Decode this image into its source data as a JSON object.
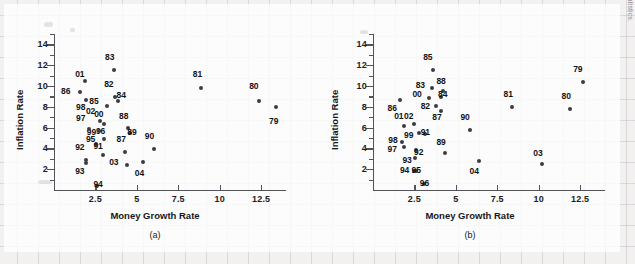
{
  "figure": {
    "source_note": "SOURCE: Federal Reserve System and Bureau of Labor Statistics.",
    "axis_titles": {
      "x": "Money Growth Rate",
      "y": "Inflation Rate"
    },
    "captions": {
      "a": "(a)",
      "b": "(b)"
    }
  },
  "chart_data": [
    {
      "type": "scatter",
      "title": "(a)",
      "xlabel": "Money Growth Rate",
      "ylabel": "Inflation Rate",
      "xlim": [
        0,
        14
      ],
      "ylim": [
        0,
        15
      ],
      "xticks": [
        2.5,
        5,
        7.5,
        10,
        12.5
      ],
      "xtick_labels": [
        "2.5",
        "5",
        "7.5",
        "10",
        "12.5"
      ],
      "yticks": [
        2,
        4,
        6,
        8,
        10,
        12,
        14
      ],
      "ytick_labels": [
        "2",
        "4",
        "6",
        "8",
        "10",
        "12",
        "14"
      ],
      "grid": false,
      "legend": "none",
      "point_label_field": "year",
      "points": [
        {
          "year": "79",
          "x": 13.4,
          "y": 8.0,
          "lx": 13.4,
          "ly": 6.6
        },
        {
          "year": "80",
          "x": 12.4,
          "y": 8.6,
          "lx": 12.2,
          "ly": 10.0
        },
        {
          "year": "81",
          "x": 8.9,
          "y": 9.8,
          "lx": 8.8,
          "ly": 11.2
        },
        {
          "year": "82",
          "x": 3.7,
          "y": 8.9,
          "lx": 3.45,
          "ly": 10.2
        },
        {
          "year": "83",
          "x": 3.65,
          "y": 11.5,
          "lx": 3.5,
          "ly": 12.8
        },
        {
          "year": "84",
          "x": 3.85,
          "y": 8.6,
          "lx": 4.2,
          "ly": 9.1
        },
        {
          "year": "85",
          "x": 3.2,
          "y": 8.1,
          "lx": 2.55,
          "ly": 8.6
        },
        {
          "year": "88",
          "x": 4.45,
          "y": 6.0,
          "lx": 4.35,
          "ly": 7.1
        },
        {
          "year": "89",
          "x": 4.6,
          "y": 5.5,
          "lx": 4.85,
          "ly": 5.6
        },
        {
          "year": "90",
          "x": 6.05,
          "y": 3.9,
          "lx": 5.9,
          "ly": 5.2
        },
        {
          "year": "87",
          "x": 4.3,
          "y": 3.7,
          "lx": 4.2,
          "ly": 4.9
        },
        {
          "year": "03",
          "x": 4.4,
          "y": 2.4,
          "lx": 3.75,
          "ly": 2.7
        },
        {
          "year": "04",
          "x": 5.4,
          "y": 2.7,
          "lx": 5.3,
          "ly": 1.65
        },
        {
          "year": "00",
          "x": 3.0,
          "y": 6.3,
          "lx": 2.85,
          "ly": 7.3
        },
        {
          "year": "02",
          "x": 2.75,
          "y": 6.6,
          "lx": 2.35,
          "ly": 7.6
        },
        {
          "year": "96",
          "x": 3.0,
          "y": 4.9,
          "lx": 2.95,
          "ly": 5.7
        },
        {
          "year": "99",
          "x": 2.7,
          "y": 5.7,
          "lx": 2.4,
          "ly": 5.6
        },
        {
          "year": "95",
          "x": 2.55,
          "y": 4.4,
          "lx": 2.35,
          "ly": 4.9
        },
        {
          "year": "97",
          "x": 2.1,
          "y": 5.9,
          "lx": 1.75,
          "ly": 6.9
        },
        {
          "year": "98",
          "x": 1.95,
          "y": 8.7,
          "lx": 1.75,
          "ly": 8.0
        },
        {
          "year": "91",
          "x": 2.95,
          "y": 3.4,
          "lx": 2.8,
          "ly": 4.2
        },
        {
          "year": "92",
          "x": 1.95,
          "y": 2.9,
          "lx": 1.7,
          "ly": 4.1
        },
        {
          "year": "93",
          "x": 1.95,
          "y": 2.6,
          "lx": 1.7,
          "ly": 1.8
        },
        {
          "year": "94",
          "x": 2.6,
          "y": 0.4,
          "lx": 2.8,
          "ly": 0.6
        },
        {
          "year": "01",
          "x": 1.85,
          "y": 10.5,
          "lx": 1.7,
          "ly": 11.2
        },
        {
          "year": "86",
          "x": 1.55,
          "y": 9.4,
          "lx": 0.85,
          "ly": 9.5
        }
      ]
    },
    {
      "type": "scatter",
      "title": "(b)",
      "xlabel": "Money Growth Rate",
      "ylabel": "Inflation Rate",
      "xlim": [
        0,
        14
      ],
      "ylim": [
        0,
        15
      ],
      "xticks": [
        2.5,
        5,
        7.5,
        10,
        12.5
      ],
      "xtick_labels": [
        "2.5",
        "5",
        "7.5",
        "10",
        "12.5"
      ],
      "yticks": [
        2,
        4,
        6,
        8,
        10,
        12,
        14
      ],
      "ytick_labels": [
        "2",
        "4",
        "6",
        "8",
        "10",
        "12",
        "14"
      ],
      "grid": false,
      "legend": "none",
      "point_label_field": "year",
      "points": [
        {
          "year": "79",
          "x": 12.7,
          "y": 10.4,
          "lx": 12.5,
          "ly": 11.6
        },
        {
          "year": "80",
          "x": 11.9,
          "y": 7.8,
          "lx": 11.8,
          "ly": 9.0
        },
        {
          "year": "81",
          "x": 8.4,
          "y": 8.0,
          "lx": 8.3,
          "ly": 9.2
        },
        {
          "year": "85",
          "x": 3.6,
          "y": 11.5,
          "lx": 3.45,
          "ly": 12.8
        },
        {
          "year": "88",
          "x": 4.25,
          "y": 9.5,
          "lx": 4.25,
          "ly": 10.5
        },
        {
          "year": "83",
          "x": 3.55,
          "y": 9.8,
          "lx": 3.0,
          "ly": 10.1
        },
        {
          "year": "84",
          "x": 4.1,
          "y": 8.9,
          "lx": 4.35,
          "ly": 9.2
        },
        {
          "year": "00",
          "x": 3.35,
          "y": 8.8,
          "lx": 2.8,
          "ly": 9.2
        },
        {
          "year": "82",
          "x": 3.8,
          "y": 8.1,
          "lx": 3.3,
          "ly": 8.1
        },
        {
          "year": "87",
          "x": 4.1,
          "y": 7.6,
          "lx": 4.0,
          "ly": 7.0
        },
        {
          "year": "86",
          "x": 1.6,
          "y": 8.7,
          "lx": 1.3,
          "ly": 7.9
        },
        {
          "year": "90",
          "x": 5.85,
          "y": 5.8,
          "lx": 5.7,
          "ly": 7.0
        },
        {
          "year": "01",
          "x": 1.9,
          "y": 6.2,
          "lx": 1.7,
          "ly": 7.1
        },
        {
          "year": "02",
          "x": 2.45,
          "y": 6.3,
          "lx": 2.3,
          "ly": 7.1
        },
        {
          "year": "99",
          "x": 2.75,
          "y": 5.5,
          "lx": 2.3,
          "ly": 5.3
        },
        {
          "year": "91",
          "x": 3.15,
          "y": 5.4,
          "lx": 3.3,
          "ly": 5.6
        },
        {
          "year": "98",
          "x": 1.75,
          "y": 4.6,
          "lx": 1.35,
          "ly": 4.8
        },
        {
          "year": "97",
          "x": 1.85,
          "y": 4.1,
          "lx": 1.3,
          "ly": 3.9
        },
        {
          "year": "89",
          "x": 4.35,
          "y": 3.6,
          "lx": 4.25,
          "ly": 4.6
        },
        {
          "year": "92",
          "x": 2.6,
          "y": 3.8,
          "lx": 2.9,
          "ly": 3.7
        },
        {
          "year": "93",
          "x": 2.55,
          "y": 3.1,
          "lx": 2.2,
          "ly": 2.9
        },
        {
          "year": "94",
          "x": 2.45,
          "y": 1.85,
          "lx": 2.05,
          "ly": 1.95
        },
        {
          "year": "95",
          "x": 2.6,
          "y": 1.85,
          "lx": 2.75,
          "ly": 1.95
        },
        {
          "year": "96",
          "x": 3.05,
          "y": 0.55,
          "lx": 3.25,
          "ly": 0.7
        },
        {
          "year": "03",
          "x": 10.2,
          "y": 2.5,
          "lx": 10.1,
          "ly": 3.6
        },
        {
          "year": "04",
          "x": 6.4,
          "y": 2.8,
          "lx": 6.25,
          "ly": 1.8
        }
      ]
    }
  ]
}
